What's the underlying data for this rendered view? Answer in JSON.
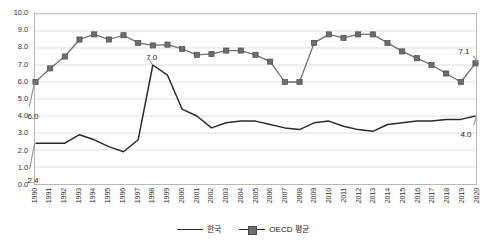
{
  "chart_data": {
    "type": "line",
    "title": "",
    "subtitle": "",
    "xlabel": "",
    "ylabel": "",
    "grid": true,
    "legend_position": "bottom",
    "ylim": [
      0.0,
      10.0
    ],
    "ytick_step": 1.0,
    "ytick_labels": [
      "10.0",
      "9.0",
      "8.0",
      "7.0",
      "6.0",
      "5.0",
      "4.0",
      "3.0",
      "2.0",
      "1.0",
      "0.0"
    ],
    "ytick_values": [
      10.0,
      9.0,
      8.0,
      7.0,
      6.0,
      5.0,
      4.0,
      3.0,
      2.0,
      1.0,
      0.0
    ],
    "categories": [
      "1990",
      "1991",
      "1992",
      "1993",
      "1994",
      "1995",
      "1996",
      "1997",
      "1998",
      "1999",
      "2000",
      "2001",
      "2002",
      "2003",
      "2004",
      "2005",
      "2006",
      "2007",
      "2008",
      "2009",
      "2010",
      "2011",
      "2012",
      "2013",
      "2014",
      "2015",
      "2016",
      "2017",
      "2018",
      "2019",
      "2020"
    ],
    "series": [
      {
        "name": "한국",
        "marker": "none",
        "color": "#2b2b2b",
        "values": [
          2.4,
          2.4,
          2.4,
          2.9,
          2.6,
          2.2,
          1.9,
          2.6,
          7.0,
          6.4,
          4.4,
          4.0,
          3.3,
          3.6,
          3.7,
          3.7,
          3.5,
          3.3,
          3.2,
          3.6,
          3.7,
          3.4,
          3.2,
          3.1,
          3.5,
          3.6,
          3.7,
          3.7,
          3.8,
          3.8,
          4.0
        ]
      },
      {
        "name": "OECD 평균",
        "marker": "square",
        "color": "#6e6e6e",
        "values": [
          6.0,
          6.8,
          7.5,
          8.5,
          8.8,
          8.5,
          8.75,
          8.3,
          8.15,
          8.2,
          7.95,
          7.6,
          7.65,
          7.85,
          7.85,
          7.6,
          7.2,
          6.0,
          6.0,
          8.3,
          8.8,
          8.6,
          8.8,
          8.8,
          8.3,
          7.8,
          7.4,
          7.0,
          6.5,
          6.0,
          7.1
        ]
      }
    ],
    "annotations": [
      {
        "id": "oecd-start",
        "text": "6.0",
        "series": "OECD 평균",
        "x": "1990",
        "y": 6.0
      },
      {
        "id": "korea-start",
        "text": "2.4",
        "series": "한국",
        "x": "1990",
        "y": 2.4
      },
      {
        "id": "korea-peak",
        "text": "7.0",
        "series": "한국",
        "x": "1998",
        "y": 7.0
      },
      {
        "id": "oecd-end",
        "text": "7.1",
        "series": "OECD 평균",
        "x": "2020",
        "y": 7.1
      },
      {
        "id": "korea-end",
        "text": "4.0",
        "series": "한국",
        "x": "2020",
        "y": 4.0
      }
    ]
  },
  "legend": {
    "items": [
      {
        "label": "한국",
        "marker": "line"
      },
      {
        "label": "OECD 평균",
        "marker": "line-square"
      }
    ]
  }
}
